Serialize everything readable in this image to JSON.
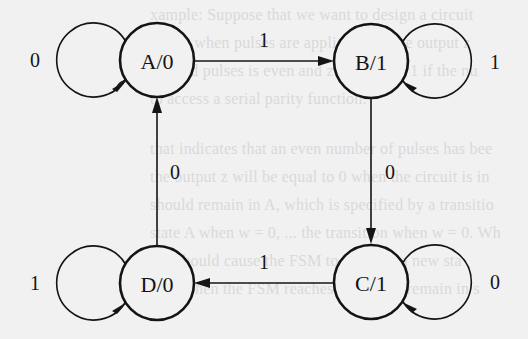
{
  "diagram": {
    "type": "moore-fsm-state-diagram",
    "background_color": "#f1f1f1",
    "ink_color": "#141414",
    "states": [
      {
        "id": "A",
        "label": "A/0",
        "output": "0",
        "cx": 157,
        "cy": 60
      },
      {
        "id": "B",
        "label": "B/1",
        "output": "1",
        "cx": 371,
        "cy": 61
      },
      {
        "id": "C",
        "label": "C/1",
        "output": "1",
        "cx": 371,
        "cy": 282
      },
      {
        "id": "D",
        "label": "D/0",
        "output": "0",
        "cx": 157,
        "cy": 283
      }
    ],
    "transitions": [
      {
        "from": "A",
        "to": "A",
        "input": "0",
        "label": "0"
      },
      {
        "from": "A",
        "to": "B",
        "input": "1",
        "label": "1"
      },
      {
        "from": "B",
        "to": "B",
        "input": "1",
        "label": "1"
      },
      {
        "from": "B",
        "to": "C",
        "input": "0",
        "label": "0"
      },
      {
        "from": "C",
        "to": "C",
        "input": "0",
        "label": "0"
      },
      {
        "from": "C",
        "to": "D",
        "input": "1",
        "label": "1"
      },
      {
        "from": "D",
        "to": "D",
        "input": "1",
        "label": "1"
      },
      {
        "from": "D",
        "to": "A",
        "input": "0",
        "label": "0"
      }
    ]
  },
  "bleed_through_text": [
    "xample:  Suppose that we want to design a circuit",
    "which when pulses are applied to w, the output z",
    "applied pulses is even and z is equal to 1 if the nu",
    "to access a serial parity function.",
    "",
    "that indicates that an even number of pulses has bee",
    "the output z will be equal to 0 when the circuit is in",
    "should remain in A, which is specified by a transitio",
    "state A when w = 0, ... the transition when w = 0. Wh",
    "= 1 should cause the FSM to move to a new sta",
    "= 1. When the FSM reaches B, it must remain in s"
  ]
}
